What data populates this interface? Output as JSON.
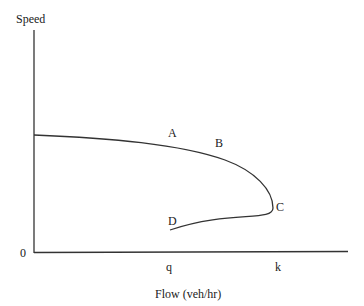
{
  "diagram": {
    "y_axis_label": "Speed",
    "x_axis_label": "Flow (veh/hr)",
    "origin_label": "0",
    "x_ticks": [
      {
        "label": "q"
      },
      {
        "label": "k"
      }
    ],
    "curve_points": [
      {
        "label": "A"
      },
      {
        "label": "B"
      },
      {
        "label": "C"
      },
      {
        "label": "D"
      }
    ],
    "colors": {
      "line": "#333333",
      "text": "#1a1a1a",
      "background": "#ffffff"
    }
  }
}
